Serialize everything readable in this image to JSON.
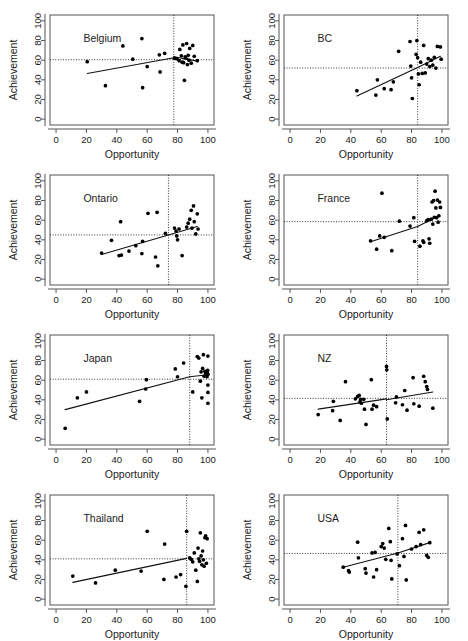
{
  "figure": {
    "type": "scatter-matrix",
    "panel_count": 8,
    "rows": 4,
    "cols": 2,
    "xlabel": "Opportunity",
    "ylabel": "Achievement",
    "xticks": [
      0,
      20,
      40,
      60,
      80,
      100
    ],
    "yticks": [
      0,
      20,
      40,
      60,
      80,
      100
    ],
    "xlim": [
      -4,
      104
    ],
    "ylim": [
      -6,
      106
    ]
  },
  "chart_data": [
    {
      "type": "scatter",
      "title": "Belgium",
      "xlabel": "Opportunity",
      "ylabel": "Achievement",
      "xlim": [
        -4,
        104
      ],
      "ylim": [
        -6,
        106
      ],
      "xticks": [
        0,
        20,
        40,
        60,
        80,
        100
      ],
      "yticks": [
        0,
        20,
        40,
        60,
        80,
        100
      ],
      "grid": false,
      "hline": 60.5,
      "vline": 77.5,
      "fit_segments": [
        [
          [
            20.5,
            46.5
          ],
          [
            77.5,
            62.5
          ]
        ],
        [
          [
            77.5,
            63.5
          ],
          [
            93.0,
            59.0
          ]
        ]
      ],
      "points": [
        [
          20.5,
          58.5
        ],
        [
          32.5,
          34.0
        ],
        [
          44.0,
          74.5
        ],
        [
          50.5,
          61.0
        ],
        [
          56.5,
          82.0
        ],
        [
          57.0,
          32.0
        ],
        [
          60.0,
          53.5
        ],
        [
          68.0,
          65.5
        ],
        [
          68.5,
          48.0
        ],
        [
          71.5,
          67.0
        ],
        [
          78.0,
          62.0
        ],
        [
          79.5,
          61.5
        ],
        [
          81.0,
          59.5
        ],
        [
          81.5,
          71.0
        ],
        [
          82.5,
          64.5
        ],
        [
          83.0,
          58.0
        ],
        [
          83.5,
          75.5
        ],
        [
          84.0,
          57.5
        ],
        [
          84.5,
          39.5
        ],
        [
          85.0,
          63.5
        ],
        [
          85.5,
          62.0
        ],
        [
          86.0,
          77.0
        ],
        [
          86.5,
          55.5
        ],
        [
          87.0,
          65.0
        ],
        [
          87.5,
          60.0
        ],
        [
          88.0,
          72.0
        ],
        [
          89.0,
          57.0
        ],
        [
          90.0,
          75.0
        ],
        [
          91.0,
          64.0
        ],
        [
          93.0,
          59.5
        ]
      ]
    },
    {
      "type": "scatter",
      "title": "BC",
      "xlabel": "Opportunity",
      "ylabel": "Achievement",
      "xlim": [
        -4,
        104
      ],
      "ylim": [
        -6,
        106
      ],
      "xticks": [
        0,
        20,
        40,
        60,
        80,
        100
      ],
      "yticks": [
        0,
        20,
        40,
        60,
        80,
        100
      ],
      "grid": false,
      "hline": 52.0,
      "vline": 84.0,
      "fit_segments": [
        [
          [
            44.0,
            23.5
          ],
          [
            84.0,
            52.5
          ]
        ],
        [
          [
            84.0,
            52.5
          ],
          [
            99.0,
            64.0
          ]
        ]
      ],
      "points": [
        [
          44.0,
          29.0
        ],
        [
          56.5,
          24.5
        ],
        [
          57.5,
          40.0
        ],
        [
          62.0,
          31.0
        ],
        [
          66.5,
          30.0
        ],
        [
          68.0,
          38.0
        ],
        [
          71.5,
          69.0
        ],
        [
          79.0,
          79.0
        ],
        [
          79.5,
          54.0
        ],
        [
          80.0,
          42.0
        ],
        [
          80.5,
          21.0
        ],
        [
          83.0,
          66.0
        ],
        [
          83.5,
          80.0
        ],
        [
          84.0,
          62.5
        ],
        [
          84.5,
          46.0
        ],
        [
          85.0,
          35.0
        ],
        [
          86.0,
          58.0
        ],
        [
          87.0,
          46.5
        ],
        [
          88.0,
          75.0
        ],
        [
          89.0,
          47.0
        ],
        [
          90.0,
          56.0
        ],
        [
          91.0,
          61.5
        ],
        [
          92.0,
          53.5
        ],
        [
          93.0,
          60.0
        ],
        [
          94.0,
          55.0
        ],
        [
          95.0,
          63.0
        ],
        [
          96.0,
          52.0
        ],
        [
          97.0,
          74.0
        ],
        [
          99.0,
          73.5
        ],
        [
          99.5,
          61.0
        ]
      ]
    },
    {
      "type": "scatter",
      "title": "Ontario",
      "xlabel": "Opportunity",
      "ylabel": "Achievement",
      "xlim": [
        -4,
        104
      ],
      "ylim": [
        -6,
        106
      ],
      "xticks": [
        0,
        20,
        40,
        60,
        80,
        100
      ],
      "yticks": [
        0,
        20,
        40,
        60,
        80,
        100
      ],
      "grid": false,
      "hline": 45.0,
      "vline": 74.0,
      "fit_segments": [
        [
          [
            30.0,
            25.0
          ],
          [
            74.0,
            45.0
          ]
        ],
        [
          [
            74.0,
            45.0
          ],
          [
            93.0,
            53.5
          ]
        ]
      ],
      "points": [
        [
          30.0,
          26.5
        ],
        [
          36.5,
          39.5
        ],
        [
          41.5,
          24.0
        ],
        [
          42.5,
          58.5
        ],
        [
          43.0,
          24.5
        ],
        [
          48.0,
          28.5
        ],
        [
          52.5,
          34.0
        ],
        [
          56.5,
          26.0
        ],
        [
          57.0,
          38.5
        ],
        [
          60.5,
          67.0
        ],
        [
          65.5,
          22.5
        ],
        [
          66.5,
          68.0
        ],
        [
          67.0,
          13.5
        ],
        [
          72.0,
          46.5
        ],
        [
          78.0,
          52.0
        ],
        [
          79.0,
          49.0
        ],
        [
          79.5,
          44.0
        ],
        [
          80.0,
          40.0
        ],
        [
          81.0,
          51.0
        ],
        [
          83.0,
          24.0
        ],
        [
          86.0,
          53.0
        ],
        [
          87.0,
          57.0
        ],
        [
          88.0,
          61.0
        ],
        [
          89.0,
          70.0
        ],
        [
          89.5,
          52.0
        ],
        [
          90.5,
          74.5
        ],
        [
          91.0,
          58.5
        ],
        [
          92.0,
          46.0
        ],
        [
          93.0,
          66.5
        ],
        [
          93.5,
          51.0
        ]
      ]
    },
    {
      "type": "scatter",
      "title": "France",
      "xlabel": "Opportunity",
      "ylabel": "Achievement",
      "xlim": [
        -4,
        104
      ],
      "ylim": [
        -6,
        106
      ],
      "xticks": [
        0,
        20,
        40,
        60,
        80,
        100
      ],
      "yticks": [
        0,
        20,
        40,
        60,
        80,
        100
      ],
      "grid": false,
      "hline": 58.5,
      "vline": 84.0,
      "fit_segments": [
        [
          [
            53.0,
            38.0
          ],
          [
            84.0,
            53.5
          ]
        ],
        [
          [
            84.0,
            53.5
          ],
          [
            98.0,
            64.5
          ]
        ]
      ],
      "points": [
        [
          53.0,
          39.0
        ],
        [
          57.0,
          30.5
        ],
        [
          59.0,
          44.0
        ],
        [
          60.5,
          87.5
        ],
        [
          62.0,
          42.5
        ],
        [
          67.0,
          29.0
        ],
        [
          72.0,
          59.0
        ],
        [
          79.0,
          54.0
        ],
        [
          81.5,
          62.5
        ],
        [
          82.0,
          38.5
        ],
        [
          85.5,
          33.5
        ],
        [
          87.5,
          39.0
        ],
        [
          88.0,
          37.5
        ],
        [
          90.0,
          59.5
        ],
        [
          91.0,
          60.5
        ],
        [
          91.5,
          41.0
        ],
        [
          92.0,
          36.5
        ],
        [
          93.0,
          61.0
        ],
        [
          93.5,
          78.5
        ],
        [
          94.0,
          56.0
        ],
        [
          94.5,
          80.0
        ],
        [
          95.0,
          63.0
        ],
        [
          95.5,
          89.5
        ],
        [
          96.0,
          72.5
        ],
        [
          96.5,
          62.5
        ],
        [
          97.0,
          80.5
        ],
        [
          97.5,
          58.0
        ],
        [
          98.0,
          64.5
        ],
        [
          98.5,
          78.5
        ],
        [
          99.0,
          73.0
        ]
      ]
    },
    {
      "type": "scatter",
      "title": "Japan",
      "xlabel": "Opportunity",
      "ylabel": "Achievement",
      "xlim": [
        -4,
        104
      ],
      "ylim": [
        -6,
        106
      ],
      "xticks": [
        0,
        20,
        40,
        60,
        80,
        100
      ],
      "yticks": [
        0,
        20,
        40,
        60,
        80,
        100
      ],
      "grid": false,
      "hline": 61.0,
      "vline": 88.0,
      "fit_segments": [
        [
          [
            6.0,
            30.0
          ],
          [
            88.0,
            63.5
          ]
        ],
        [
          [
            88.0,
            63.5
          ],
          [
            100.0,
            65.5
          ]
        ]
      ],
      "points": [
        [
          6.0,
          11.0
        ],
        [
          14.0,
          42.0
        ],
        [
          20.0,
          48.0
        ],
        [
          55.0,
          38.5
        ],
        [
          59.0,
          51.0
        ],
        [
          59.5,
          60.5
        ],
        [
          78.5,
          71.5
        ],
        [
          80.0,
          63.5
        ],
        [
          84.0,
          77.5
        ],
        [
          90.0,
          48.0
        ],
        [
          93.0,
          84.0
        ],
        [
          94.0,
          82.5
        ],
        [
          95.0,
          59.0
        ],
        [
          95.5,
          68.5
        ],
        [
          96.0,
          42.0
        ],
        [
          96.5,
          72.0
        ],
        [
          97.0,
          86.0
        ],
        [
          97.5,
          64.0
        ],
        [
          98.0,
          69.0
        ],
        [
          98.5,
          66.5
        ],
        [
          99.0,
          68.0
        ],
        [
          99.2,
          65.0
        ],
        [
          99.4,
          63.5
        ],
        [
          99.6,
          67.5
        ],
        [
          99.8,
          70.0
        ],
        [
          100.0,
          66.0
        ],
        [
          100.0,
          55.0
        ],
        [
          100.0,
          47.5
        ],
        [
          100.0,
          36.5
        ],
        [
          100.0,
          84.5
        ]
      ]
    },
    {
      "type": "scatter",
      "title": "NZ",
      "xlabel": "Opportunity",
      "ylabel": "Achievement",
      "xlim": [
        -4,
        104
      ],
      "ylim": [
        -6,
        106
      ],
      "xticks": [
        0,
        20,
        40,
        60,
        80,
        100
      ],
      "yticks": [
        0,
        20,
        40,
        60,
        80,
        100
      ],
      "grid": false,
      "hline": 41.5,
      "vline": 63.5,
      "fit_segments": [
        [
          [
            18.5,
            30.5
          ],
          [
            63.5,
            41.0
          ]
        ],
        [
          [
            63.5,
            40.0
          ],
          [
            94.0,
            48.0
          ]
        ]
      ],
      "points": [
        [
          18.5,
          25.0
        ],
        [
          28.0,
          29.0
        ],
        [
          28.5,
          38.5
        ],
        [
          33.0,
          19.0
        ],
        [
          36.5,
          58.5
        ],
        [
          43.0,
          41.0
        ],
        [
          44.5,
          43.5
        ],
        [
          45.5,
          44.5
        ],
        [
          46.0,
          38.0
        ],
        [
          46.5,
          40.5
        ],
        [
          47.0,
          36.5
        ],
        [
          48.5,
          40.5
        ],
        [
          49.0,
          30.5
        ],
        [
          50.0,
          15.0
        ],
        [
          53.5,
          60.5
        ],
        [
          54.0,
          30.5
        ],
        [
          55.0,
          34.5
        ],
        [
          57.0,
          33.0
        ],
        [
          63.5,
          74.0
        ],
        [
          63.7,
          70.5
        ],
        [
          64.0,
          20.5
        ],
        [
          69.5,
          37.0
        ],
        [
          70.0,
          43.0
        ],
        [
          74.0,
          35.0
        ],
        [
          75.5,
          49.5
        ],
        [
          77.0,
          29.5
        ],
        [
          81.0,
          62.5
        ],
        [
          81.5,
          36.0
        ],
        [
          85.0,
          33.5
        ],
        [
          88.0,
          64.0
        ],
        [
          89.0,
          58.5
        ],
        [
          90.0,
          53.5
        ],
        [
          90.5,
          50.5
        ],
        [
          94.0,
          31.5
        ]
      ]
    },
    {
      "type": "scatter",
      "title": "Thailand",
      "xlabel": "Opportunity",
      "ylabel": "Achievement",
      "xlim": [
        -4,
        104
      ],
      "ylim": [
        -6,
        106
      ],
      "xticks": [
        0,
        20,
        40,
        60,
        80,
        100
      ],
      "yticks": [
        0,
        20,
        40,
        60,
        80,
        100
      ],
      "grid": false,
      "hline": 41.0,
      "vline": 86.0,
      "fit_segments": [
        [
          [
            11.0,
            17.0
          ],
          [
            86.0,
            41.5
          ]
        ]
      ],
      "points": [
        [
          11.0,
          23.5
        ],
        [
          26.0,
          16.5
        ],
        [
          39.0,
          29.5
        ],
        [
          56.0,
          28.5
        ],
        [
          60.0,
          69.0
        ],
        [
          71.0,
          20.0
        ],
        [
          71.5,
          56.0
        ],
        [
          79.0,
          22.5
        ],
        [
          82.0,
          25.0
        ],
        [
          85.5,
          13.0
        ],
        [
          86.0,
          69.0
        ],
        [
          88.0,
          42.0
        ],
        [
          89.0,
          40.5
        ],
        [
          90.0,
          38.0
        ],
        [
          91.0,
          47.0
        ],
        [
          92.0,
          29.5
        ],
        [
          93.0,
          18.0
        ],
        [
          93.5,
          52.0
        ],
        [
          94.0,
          41.0
        ],
        [
          94.5,
          38.5
        ],
        [
          95.0,
          67.5
        ],
        [
          95.5,
          44.0
        ],
        [
          96.0,
          35.0
        ],
        [
          96.5,
          49.0
        ],
        [
          97.0,
          40.0
        ],
        [
          97.5,
          33.5
        ],
        [
          98.0,
          62.5
        ],
        [
          98.5,
          64.5
        ],
        [
          99.0,
          36.5
        ],
        [
          99.5,
          61.5
        ]
      ]
    },
    {
      "type": "scatter",
      "title": "USA",
      "xlabel": "Opportunity",
      "ylabel": "Achievement",
      "xlim": [
        -4,
        104
      ],
      "ylim": [
        -6,
        106
      ],
      "xticks": [
        0,
        20,
        40,
        60,
        80,
        100
      ],
      "yticks": [
        0,
        20,
        40,
        60,
        80,
        100
      ],
      "grid": false,
      "hline": 46.5,
      "vline": 71.0,
      "fit_segments": [
        [
          [
            35.0,
            32.5
          ],
          [
            71.0,
            47.0
          ]
        ],
        [
          [
            71.0,
            47.0
          ],
          [
            92.0,
            57.5
          ]
        ]
      ],
      "points": [
        [
          35.0,
          32.5
        ],
        [
          38.5,
          29.0
        ],
        [
          39.0,
          27.5
        ],
        [
          44.5,
          58.0
        ],
        [
          45.0,
          42.0
        ],
        [
          49.5,
          31.0
        ],
        [
          50.0,
          26.5
        ],
        [
          54.0,
          47.0
        ],
        [
          55.0,
          22.5
        ],
        [
          56.0,
          47.5
        ],
        [
          57.0,
          30.0
        ],
        [
          60.0,
          53.5
        ],
        [
          61.0,
          56.5
        ],
        [
          62.0,
          52.0
        ],
        [
          63.0,
          40.5
        ],
        [
          65.0,
          72.0
        ],
        [
          66.0,
          58.5
        ],
        [
          66.5,
          39.5
        ],
        [
          67.0,
          20.5
        ],
        [
          70.5,
          46.0
        ],
        [
          72.0,
          34.0
        ],
        [
          74.0,
          61.5
        ],
        [
          75.0,
          43.5
        ],
        [
          76.0,
          75.0
        ],
        [
          76.5,
          19.5
        ],
        [
          80.0,
          51.0
        ],
        [
          83.0,
          53.5
        ],
        [
          85.0,
          68.0
        ],
        [
          86.0,
          55.5
        ],
        [
          88.0,
          70.5
        ],
        [
          90.0,
          44.5
        ],
        [
          91.0,
          42.5
        ],
        [
          92.0,
          57.5
        ]
      ]
    }
  ]
}
